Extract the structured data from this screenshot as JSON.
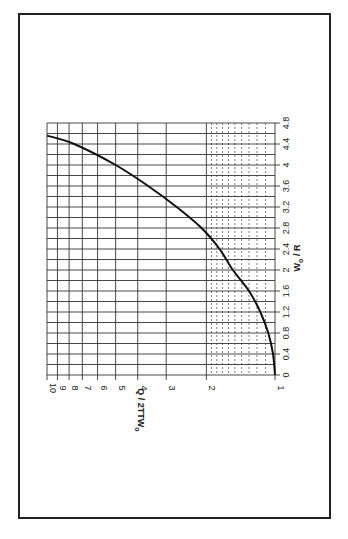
{
  "chart_data": {
    "type": "line",
    "orientation": "rotated-90-ccw",
    "title": "",
    "xlabel": "W₀ / R",
    "xlabel_main": "W",
    "xlabel_sub": "o",
    "xlabel_rest": " / R",
    "ylabel": "Q / 2πW₀",
    "ylabel_main": "Q / 2TTW",
    "ylabel_sub": "o",
    "xlim": [
      0,
      4.8
    ],
    "ylim": [
      1,
      10
    ],
    "yscale": "log",
    "grid": true,
    "x_ticks": [
      "0",
      "0.4",
      "0.8",
      "1.2",
      "1.6",
      "2",
      "2.4",
      "2.8",
      "3.2",
      "3.6",
      "4",
      "4.4",
      "4.8"
    ],
    "x_tick_values": [
      0,
      0.4,
      0.8,
      1.2,
      1.6,
      2.0,
      2.4,
      2.8,
      3.2,
      3.6,
      4.0,
      4.4,
      4.8
    ],
    "x_minor_step": 0.2,
    "y_ticks": [
      "1",
      "2",
      "3",
      "4",
      "5",
      "6",
      "7",
      "8",
      "9",
      "10"
    ],
    "y_tick_values": [
      1,
      2,
      3,
      4,
      5,
      6,
      7,
      8,
      9,
      10
    ],
    "y_minor_dashed": [
      1.1,
      1.2,
      1.3,
      1.4,
      1.5,
      1.6,
      1.7,
      1.8,
      1.9
    ],
    "series": [
      {
        "name": "Q / 2πW₀",
        "x": [
          0,
          0.4,
          0.8,
          1.2,
          1.6,
          2.0,
          2.4,
          2.8,
          3.2,
          3.6,
          4.0,
          4.4,
          4.56
        ],
        "y": [
          1.0,
          1.02,
          1.07,
          1.16,
          1.3,
          1.53,
          1.75,
          2.1,
          2.7,
          3.6,
          5.0,
          7.6,
          10.0
        ]
      }
    ]
  }
}
